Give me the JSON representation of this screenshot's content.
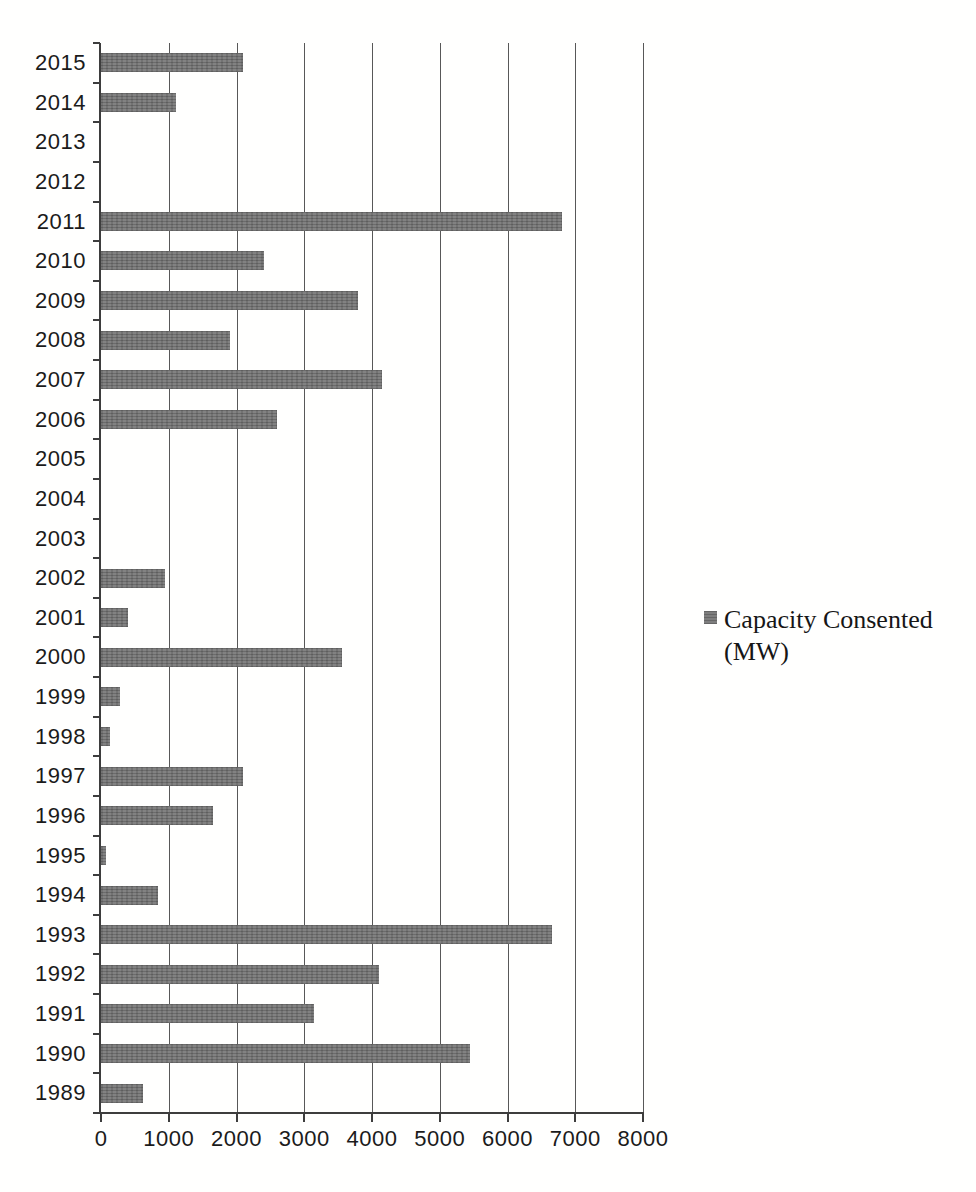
{
  "chart_data": {
    "type": "bar",
    "orientation": "horizontal",
    "title": "",
    "xlabel": "",
    "ylabel": "",
    "categories": [
      "2015",
      "2014",
      "2013",
      "2012",
      "2011",
      "2010",
      "2009",
      "2008",
      "2007",
      "2006",
      "2005",
      "2004",
      "2003",
      "2002",
      "2001",
      "2000",
      "1999",
      "1998",
      "1997",
      "1996",
      "1995",
      "1994",
      "1993",
      "1992",
      "1991",
      "1990",
      "1989"
    ],
    "series": [
      {
        "name": "Capacity Consented (MW)",
        "values": [
          2100,
          1100,
          0,
          0,
          6800,
          2400,
          3800,
          1900,
          4150,
          2600,
          0,
          0,
          0,
          950,
          400,
          3550,
          280,
          140,
          2100,
          1650,
          75,
          840,
          6650,
          4100,
          3150,
          5450,
          620
        ]
      }
    ],
    "xlim": [
      0,
      8000
    ],
    "x_ticks": [
      0,
      1000,
      2000,
      3000,
      4000,
      5000,
      6000,
      7000,
      8000
    ],
    "grid": "vertical-only",
    "legend_position": "right"
  },
  "legend": {
    "label_line1": "Capacity Consented",
    "label_line2": "(MW)"
  },
  "colors": {
    "bar": "#767676",
    "gridline": "#585858",
    "axis": "#3d3d3d",
    "text": "#1b1b1b",
    "background": "#ffffff"
  }
}
